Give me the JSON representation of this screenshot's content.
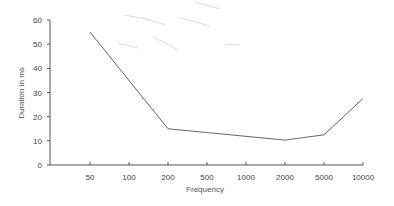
{
  "chart_data": {
    "type": "line",
    "title": "",
    "xlabel": "Frequency",
    "ylabel": "Duration in ms",
    "categories": [
      "50",
      "100",
      "200",
      "500",
      "1000",
      "2000",
      "5000",
      "10000"
    ],
    "series": [
      {
        "name": "Duration",
        "x": [
          "50",
          "200",
          "2000",
          "5000",
          "10000"
        ],
        "values": [
          55,
          15,
          10.3,
          12.5,
          27.5
        ]
      }
    ],
    "yticks": [
      0,
      10,
      20,
      30,
      40,
      50,
      60
    ],
    "ylim": [
      0,
      60
    ],
    "grid": false,
    "legend": "none",
    "line_color": "#555555",
    "axis_color": "#444444"
  }
}
